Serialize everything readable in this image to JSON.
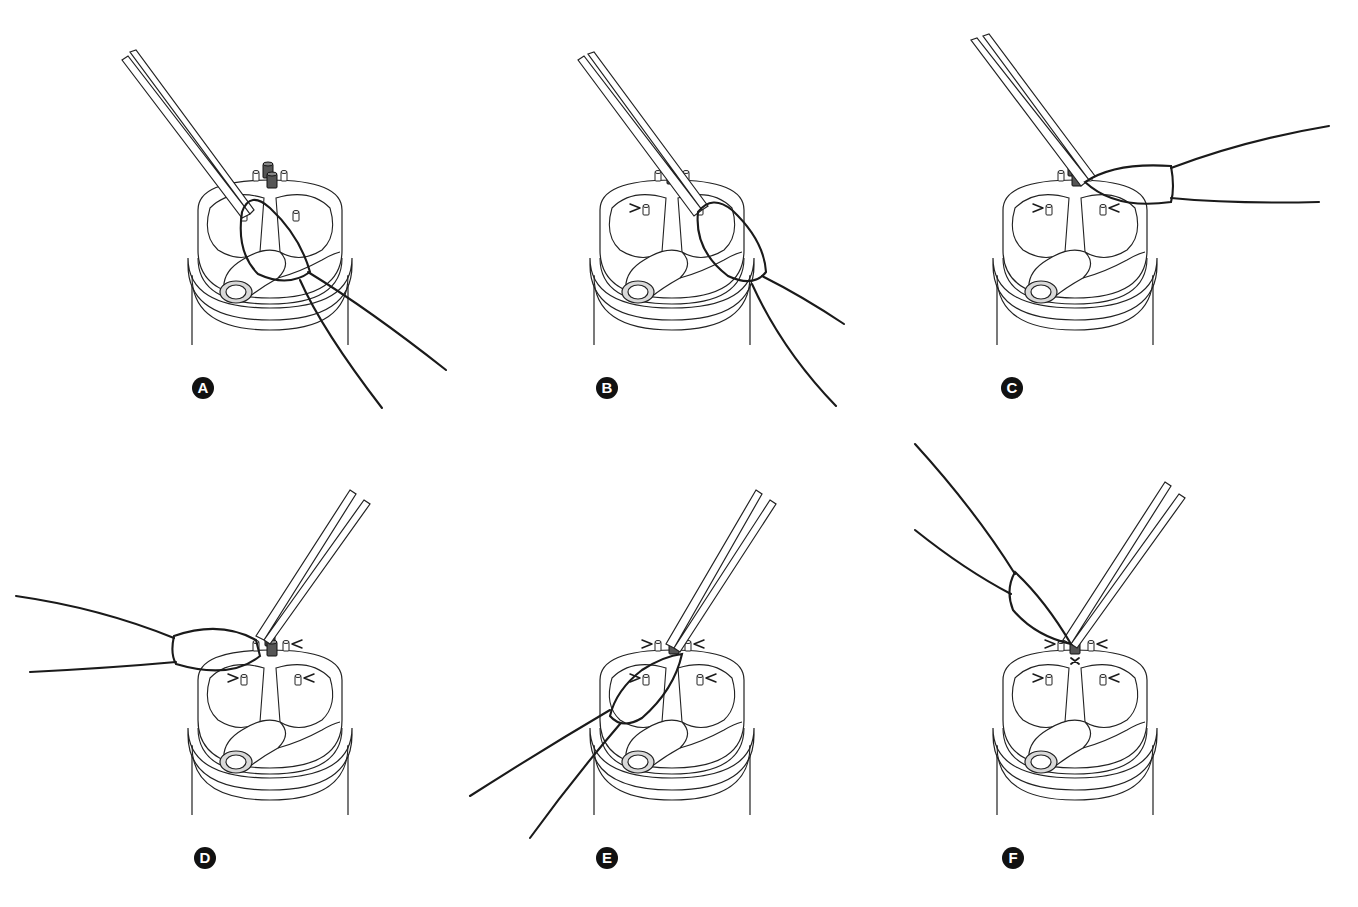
{
  "figure": {
    "type": "surgical-technique-illustration",
    "panel_count": 6,
    "colors": {
      "ink": "#1a1a1a",
      "background": "#ffffff",
      "shade": "#d9d9d9",
      "dark_post": "#555555"
    }
  },
  "panels": [
    {
      "label": "A",
      "label_pos": [
        192,
        377
      ],
      "center": [
        270,
        180
      ],
      "step": "loop-around-left-post"
    },
    {
      "label": "B",
      "label_pos": [
        596,
        377
      ],
      "center": [
        672,
        180
      ],
      "step": "loop-around-right-post"
    },
    {
      "label": "C",
      "label_pos": [
        1001,
        377
      ],
      "center": [
        1075,
        180
      ],
      "step": "loop-pulled-right-to-center-post"
    },
    {
      "label": "D",
      "label_pos": [
        194,
        847
      ],
      "center": [
        270,
        650
      ],
      "step": "loop-pulled-left-to-center-post"
    },
    {
      "label": "E",
      "label_pos": [
        596,
        847
      ],
      "center": [
        672,
        650
      ],
      "step": "loop-around-center-post-down"
    },
    {
      "label": "F",
      "label_pos": [
        1002,
        847
      ],
      "center": [
        1075,
        650
      ],
      "step": "knot-secured-center-post"
    }
  ]
}
